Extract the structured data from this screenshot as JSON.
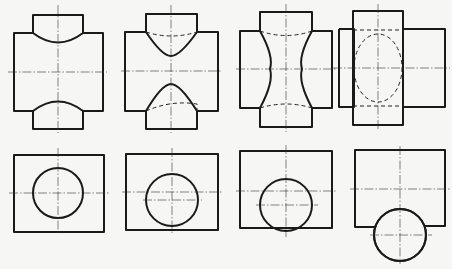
{
  "diagram": {
    "type": "technical drawing — intersecting cylinders (projections)",
    "background": "#f6f6f4",
    "line_color": "#1a1a1a",
    "rows": [
      {
        "name": "front-views",
        "figures": [
          {
            "id": "fig-1",
            "description": "Vertical cylinder smaller than horizontal; convex intersection curves top and bottom"
          },
          {
            "id": "fig-2",
            "description": "Cylinders closer in size; pointed intersection curves with hidden dashed arcs"
          },
          {
            "id": "fig-3",
            "description": "Vertical cylinder larger; hourglass-shaped intersection with hidden dashed arcs"
          },
          {
            "id": "fig-4",
            "description": "Equal-diameter-like case; hidden dashed ellipse inside vertical prism"
          }
        ]
      },
      {
        "name": "side-views",
        "figures": [
          {
            "id": "fig-5",
            "description": "Circle centered on rectangle center"
          },
          {
            "id": "fig-6",
            "description": "Circle slightly offset downward"
          },
          {
            "id": "fig-7",
            "description": "Circle offset further, tangent to bottom edge"
          },
          {
            "id": "fig-8",
            "description": "Circle offset below rectangle, protruding beyond bottom edge"
          }
        ]
      }
    ]
  }
}
